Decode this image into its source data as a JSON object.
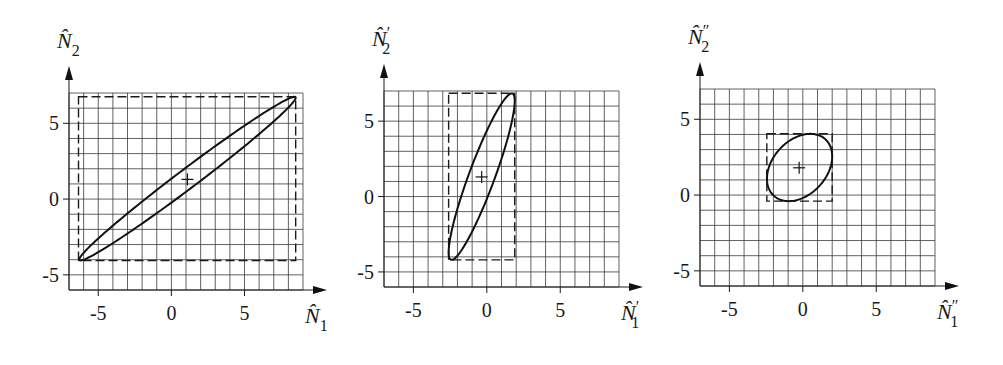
{
  "chart_data": [
    {
      "type": "scatter",
      "title": "",
      "xlabel": "N̂1",
      "ylabel": "N̂2",
      "x_label_parts": {
        "base": "N",
        "hat": "^",
        "prime": "",
        "sub": "1"
      },
      "y_label_parts": {
        "base": "N",
        "hat": "^",
        "prime": "",
        "sub": "2"
      },
      "xlim": [
        -7,
        9
      ],
      "ylim": [
        -6,
        7
      ],
      "xticks": [
        -5,
        0,
        5
      ],
      "yticks": [
        -5,
        0,
        5
      ],
      "grid": true,
      "grid_step": 1,
      "ellipse": {
        "center": [
          1.1,
          1.35
        ],
        "half_width": 7.4,
        "half_height": 5.4,
        "correlation": 0.989
      },
      "bounding_box": {
        "x": [
          -6.35,
          8.5
        ],
        "y": [
          -4.05,
          6.75
        ],
        "style": "dashed"
      },
      "center_marker": {
        "x": 1.1,
        "y": 1.3,
        "symbol": "+"
      },
      "pixel_frame": {
        "left": 69,
        "right": 303,
        "top": 93,
        "bottom": 290
      }
    },
    {
      "type": "scatter",
      "title": "",
      "xlabel": "N̂′1",
      "ylabel": "N̂′2",
      "x_label_parts": {
        "base": "N",
        "hat": "^",
        "prime": "′",
        "sub": "1"
      },
      "y_label_parts": {
        "base": "N",
        "hat": "^",
        "prime": "′",
        "sub": "2"
      },
      "xlim": [
        -7,
        9
      ],
      "ylim": [
        -6,
        7
      ],
      "xticks": [
        -5,
        0,
        5
      ],
      "yticks": [
        -5,
        0,
        5
      ],
      "grid": true,
      "grid_step": 1,
      "ellipse": {
        "center": [
          -0.35,
          1.32
        ],
        "half_width": 2.25,
        "half_height": 5.52,
        "correlation": 0.91
      },
      "bounding_box": {
        "x": [
          -2.6,
          1.9
        ],
        "y": [
          -4.2,
          6.85
        ],
        "style": "dashed"
      },
      "center_marker": {
        "x": -0.35,
        "y": 1.3,
        "symbol": "+"
      },
      "pixel_frame": {
        "left": 384,
        "right": 619,
        "top": 91,
        "bottom": 287
      }
    },
    {
      "type": "scatter",
      "title": "",
      "xlabel": "N̂″1",
      "ylabel": "N̂″2",
      "x_label_parts": {
        "base": "N",
        "hat": "^",
        "prime": "″",
        "sub": "1"
      },
      "y_label_parts": {
        "base": "N",
        "hat": "^",
        "prime": "″",
        "sub": "2"
      },
      "xlim": [
        -7,
        9
      ],
      "ylim": [
        -6,
        7
      ],
      "xticks": [
        -5,
        0,
        5
      ],
      "yticks": [
        -5,
        0,
        5
      ],
      "grid": true,
      "grid_step": 1,
      "ellipse": {
        "center": [
          -0.22,
          1.82
        ],
        "half_width": 2.22,
        "half_height": 2.22,
        "correlation": 0.33
      },
      "bounding_box": {
        "x": [
          -2.45,
          2.0
        ],
        "y": [
          -0.4,
          4.05
        ],
        "style": "dashed"
      },
      "center_marker": {
        "x": -0.25,
        "y": 1.8,
        "symbol": "+"
      },
      "pixel_frame": {
        "left": 700,
        "right": 935,
        "top": 89,
        "bottom": 286
      }
    }
  ]
}
